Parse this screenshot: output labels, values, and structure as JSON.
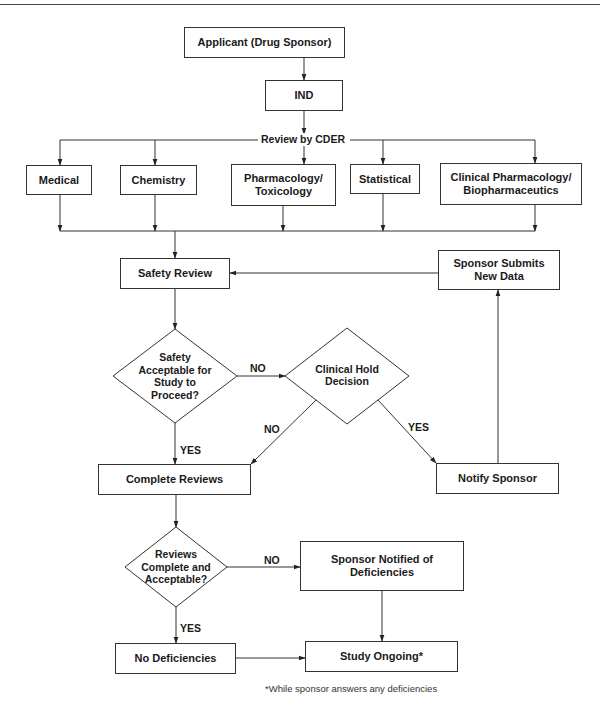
{
  "diagram": {
    "nodes": {
      "applicant": "Applicant (Drug Sponsor)",
      "ind": "IND",
      "review_by_cder": "Review by CDER",
      "medical": "Medical",
      "chemistry": "Chemistry",
      "pharm_tox": "Pharmacology/ Toxicology",
      "statistical": "Statistical",
      "clin_pharm": "Clinical Pharmacology/ Biopharmaceutics",
      "safety_review": "Safety Review",
      "sponsor_submits": "Sponsor Submits New Data",
      "safety_decision": "Safety Acceptable for Study to Proceed?",
      "clinical_hold": "Clinical Hold Decision",
      "complete_reviews": "Complete Reviews",
      "notify_sponsor": "Notify Sponsor",
      "reviews_decision": "Reviews Complete and Acceptable?",
      "sponsor_notified": "Sponsor Notified of Deficiencies",
      "no_deficiencies": "No Deficiencies",
      "study_ongoing": "Study Ongoing*"
    },
    "edge_labels": {
      "safety_no": "NO",
      "safety_yes": "YES",
      "hold_no": "NO",
      "hold_yes": "YES",
      "reviews_no": "NO",
      "reviews_yes": "YES"
    },
    "footnote": "*While sponsor answers any deficiencies",
    "edges": [
      [
        "applicant",
        "ind"
      ],
      [
        "ind",
        "review_by_cder"
      ],
      [
        "review_by_cder",
        "medical"
      ],
      [
        "review_by_cder",
        "chemistry"
      ],
      [
        "review_by_cder",
        "pharm_tox"
      ],
      [
        "review_by_cder",
        "statistical"
      ],
      [
        "review_by_cder",
        "clin_pharm"
      ],
      [
        "medical",
        "safety_review"
      ],
      [
        "chemistry",
        "safety_review"
      ],
      [
        "pharm_tox",
        "safety_review"
      ],
      [
        "statistical",
        "safety_review"
      ],
      [
        "clin_pharm",
        "safety_review"
      ],
      [
        "safety_review",
        "safety_decision"
      ],
      [
        "safety_decision",
        "clinical_hold",
        "NO"
      ],
      [
        "safety_decision",
        "complete_reviews",
        "YES"
      ],
      [
        "clinical_hold",
        "complete_reviews",
        "NO"
      ],
      [
        "clinical_hold",
        "notify_sponsor",
        "YES"
      ],
      [
        "notify_sponsor",
        "sponsor_submits"
      ],
      [
        "sponsor_submits",
        "safety_review"
      ],
      [
        "complete_reviews",
        "reviews_decision"
      ],
      [
        "reviews_decision",
        "sponsor_notified",
        "NO"
      ],
      [
        "reviews_decision",
        "no_deficiencies",
        "YES"
      ],
      [
        "sponsor_notified",
        "study_ongoing"
      ],
      [
        "no_deficiencies",
        "study_ongoing"
      ]
    ]
  }
}
